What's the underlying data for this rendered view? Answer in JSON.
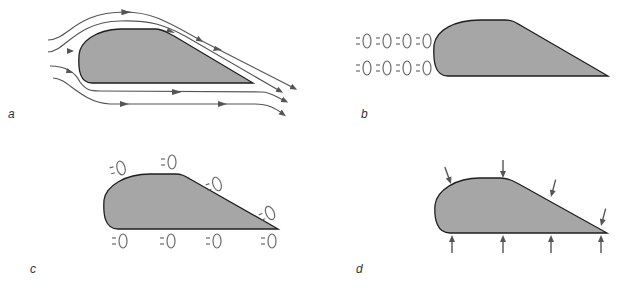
{
  "colors": {
    "airfoil_fill": "#a6a6a6",
    "outline": "#1f1f1f",
    "flow_line": "#555555",
    "particle": "#6a6a6a"
  },
  "panels": [
    {
      "id": "a",
      "label": "a",
      "content": "streamlines-around-airfoil"
    },
    {
      "id": "b",
      "label": "b",
      "content": "air-particles-ahead-of-airfoil"
    },
    {
      "id": "c",
      "label": "c",
      "content": "air-particles-along-surfaces"
    },
    {
      "id": "d",
      "label": "d",
      "content": "pressure-arrows-on-surfaces"
    }
  ]
}
